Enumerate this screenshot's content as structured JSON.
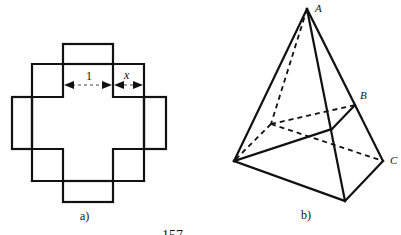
{
  "figure_a": {
    "caption": "a)",
    "dimension_labels": {
      "unit": "1",
      "variable": "x"
    },
    "description": "Cross-shaped net made of overlapping squares with a dimension line marking lengths 1 and x"
  },
  "figure_b": {
    "caption": "b)",
    "vertex_labels": {
      "apex": "A",
      "right_upper": "B",
      "right_lower": "C"
    },
    "description": "Pyramid-like solid with hidden edges drawn dashed"
  },
  "footer_fragment": "157"
}
